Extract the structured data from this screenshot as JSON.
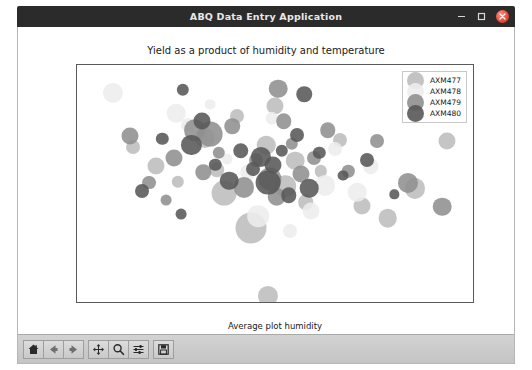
{
  "window": {
    "title": "ABQ Data Entry Application",
    "controls": [
      {
        "name": "minimize",
        "glyph": "–"
      },
      {
        "name": "maximize",
        "glyph": "□"
      },
      {
        "name": "close",
        "glyph": "×"
      }
    ]
  },
  "chart_data": {
    "type": "scatter",
    "title": "Yield as a product of humidity and temperature",
    "xlabel": "Average plot humidity",
    "ylabel": "Average Plot temperature",
    "xticks": [
      "26.0",
      "26.5",
      "27.0",
      "27.5",
      "28.0"
    ],
    "xtick_values": [
      26.0,
      26.5,
      27.0,
      27.5,
      28.0
    ],
    "yticks": [
      "23.5",
      "23.6",
      "23.7",
      "23.8",
      "23.9"
    ],
    "ytick_values": [
      23.5,
      23.6,
      23.7,
      23.8,
      23.9
    ],
    "xlim": [
      25.88,
      28.2
    ],
    "ylim": [
      23.47,
      23.95
    ],
    "grid": false,
    "legend": {
      "position": "upper right",
      "entries": [
        "AXM477",
        "AXM478",
        "AXM479",
        "AXM480"
      ],
      "colors": [
        "#bdbdbd",
        "#ededed",
        "#8f8f8f",
        "#585858"
      ]
    },
    "size_encoding": "Yield (bubble area)",
    "series": [
      {
        "name": "AXM477",
        "color": "#bdbdbd",
        "points": [
          {
            "x": 26.34,
            "y": 23.745,
            "s": 11
          },
          {
            "x": 26.47,
            "y": 23.713,
            "s": 8
          },
          {
            "x": 26.63,
            "y": 23.803,
            "s": 13
          },
          {
            "x": 26.7,
            "y": 23.738,
            "s": 10
          },
          {
            "x": 26.74,
            "y": 23.69,
            "s": 16
          },
          {
            "x": 26.82,
            "y": 23.847,
            "s": 9
          },
          {
            "x": 26.9,
            "y": 23.62,
            "s": 20
          },
          {
            "x": 26.99,
            "y": 23.787,
            "s": 12
          },
          {
            "x": 27.04,
            "y": 23.867,
            "s": 11
          },
          {
            "x": 27.1,
            "y": 23.705,
            "s": 14
          },
          {
            "x": 27.16,
            "y": 23.756,
            "s": 12
          },
          {
            "x": 27.22,
            "y": 23.672,
            "s": 10
          },
          {
            "x": 27.31,
            "y": 23.735,
            "s": 8
          },
          {
            "x": 27.42,
            "y": 23.798,
            "s": 9
          },
          {
            "x": 27.55,
            "y": 23.665,
            "s": 11
          },
          {
            "x": 27.7,
            "y": 23.64,
            "s": 12
          },
          {
            "x": 27.86,
            "y": 23.7,
            "s": 13
          },
          {
            "x": 28.05,
            "y": 23.797,
            "s": 11
          },
          {
            "x": 26.21,
            "y": 23.783,
            "s": 9
          },
          {
            "x": 27.0,
            "y": 23.483,
            "s": 13
          }
        ]
      },
      {
        "name": "AXM478",
        "color": "#ededed",
        "points": [
          {
            "x": 26.09,
            "y": 23.893,
            "s": 13
          },
          {
            "x": 26.46,
            "y": 23.852,
            "s": 12
          },
          {
            "x": 26.53,
            "y": 23.828,
            "s": 9
          },
          {
            "x": 26.88,
            "y": 23.733,
            "s": 10
          },
          {
            "x": 26.94,
            "y": 23.644,
            "s": 14
          },
          {
            "x": 27.02,
            "y": 23.842,
            "s": 8
          },
          {
            "x": 27.25,
            "y": 23.655,
            "s": 11
          },
          {
            "x": 27.33,
            "y": 23.706,
            "s": 13
          },
          {
            "x": 27.39,
            "y": 23.78,
            "s": 9
          },
          {
            "x": 27.52,
            "y": 23.692,
            "s": 12
          },
          {
            "x": 27.6,
            "y": 23.745,
            "s": 10
          },
          {
            "x": 26.76,
            "y": 23.76,
            "s": 7
          },
          {
            "x": 27.13,
            "y": 23.614,
            "s": 9
          },
          {
            "x": 26.66,
            "y": 23.87,
            "s": 7
          }
        ]
      },
      {
        "name": "AXM479",
        "color": "#8f8f8f",
        "points": [
          {
            "x": 26.19,
            "y": 23.807,
            "s": 11
          },
          {
            "x": 26.3,
            "y": 23.712,
            "s": 9
          },
          {
            "x": 26.45,
            "y": 23.762,
            "s": 11
          },
          {
            "x": 26.57,
            "y": 23.818,
            "s": 14
          },
          {
            "x": 26.66,
            "y": 23.81,
            "s": 16
          },
          {
            "x": 26.71,
            "y": 23.772,
            "s": 8
          },
          {
            "x": 26.79,
            "y": 23.826,
            "s": 10
          },
          {
            "x": 26.86,
            "y": 23.702,
            "s": 13
          },
          {
            "x": 26.93,
            "y": 23.757,
            "s": 9
          },
          {
            "x": 27.01,
            "y": 23.72,
            "s": 15
          },
          {
            "x": 27.05,
            "y": 23.683,
            "s": 12
          },
          {
            "x": 27.09,
            "y": 23.836,
            "s": 10
          },
          {
            "x": 27.14,
            "y": 23.79,
            "s": 8
          },
          {
            "x": 27.19,
            "y": 23.729,
            "s": 11
          },
          {
            "x": 27.27,
            "y": 23.762,
            "s": 9
          },
          {
            "x": 27.35,
            "y": 23.818,
            "s": 10
          },
          {
            "x": 27.47,
            "y": 23.735,
            "s": 8
          },
          {
            "x": 27.64,
            "y": 23.796,
            "s": 9
          },
          {
            "x": 27.82,
            "y": 23.712,
            "s": 13
          },
          {
            "x": 28.02,
            "y": 23.663,
            "s": 12
          },
          {
            "x": 26.4,
            "y": 23.676,
            "s": 7
          },
          {
            "x": 27.06,
            "y": 23.902,
            "s": 12
          },
          {
            "x": 26.62,
            "y": 23.733,
            "s": 10
          }
        ]
      },
      {
        "name": "AXM480",
        "color": "#585858",
        "points": [
          {
            "x": 26.26,
            "y": 23.695,
            "s": 9
          },
          {
            "x": 26.38,
            "y": 23.801,
            "s": 8
          },
          {
            "x": 26.55,
            "y": 23.788,
            "s": 13
          },
          {
            "x": 26.61,
            "y": 23.836,
            "s": 11
          },
          {
            "x": 26.69,
            "y": 23.748,
            "s": 8
          },
          {
            "x": 26.77,
            "y": 23.716,
            "s": 12
          },
          {
            "x": 26.84,
            "y": 23.776,
            "s": 10
          },
          {
            "x": 26.91,
            "y": 23.74,
            "s": 9
          },
          {
            "x": 26.96,
            "y": 23.764,
            "s": 13
          },
          {
            "x": 27.0,
            "y": 23.712,
            "s": 16
          },
          {
            "x": 27.03,
            "y": 23.748,
            "s": 11
          },
          {
            "x": 27.08,
            "y": 23.776,
            "s": 8
          },
          {
            "x": 27.12,
            "y": 23.686,
            "s": 10
          },
          {
            "x": 27.17,
            "y": 23.808,
            "s": 9
          },
          {
            "x": 27.24,
            "y": 23.7,
            "s": 12
          },
          {
            "x": 27.3,
            "y": 23.772,
            "s": 8
          },
          {
            "x": 27.44,
            "y": 23.726,
            "s": 7
          },
          {
            "x": 27.58,
            "y": 23.758,
            "s": 9
          },
          {
            "x": 27.74,
            "y": 23.688,
            "s": 6
          },
          {
            "x": 26.49,
            "y": 23.648,
            "s": 7
          },
          {
            "x": 26.5,
            "y": 23.9,
            "s": 8
          },
          {
            "x": 27.21,
            "y": 23.891,
            "s": 10
          }
        ]
      }
    ]
  },
  "toolbar": {
    "buttons": [
      {
        "name": "home-button",
        "icon": "home-icon",
        "tooltip": "Home"
      },
      {
        "name": "back-button",
        "icon": "arrow-left-icon",
        "tooltip": "Back"
      },
      {
        "name": "forward-button",
        "icon": "arrow-right-icon",
        "tooltip": "Forward"
      },
      {
        "name": "pan-button",
        "icon": "move-icon",
        "tooltip": "Pan"
      },
      {
        "name": "zoom-button",
        "icon": "magnifier-icon",
        "tooltip": "Zoom"
      },
      {
        "name": "configure-subplots-button",
        "icon": "sliders-icon",
        "tooltip": "Configure subplots"
      },
      {
        "name": "save-button",
        "icon": "floppy-disk-icon",
        "tooltip": "Save"
      }
    ]
  }
}
